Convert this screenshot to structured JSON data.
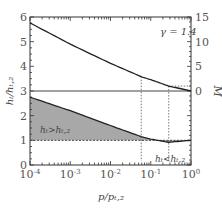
{
  "chart_data": {
    "type": "line",
    "title": "",
    "annotation": "γ = 1.4",
    "xlabel": "p/p_{t,2}",
    "ylabel_left": "h_t/h_{t,2}",
    "ylabel_right": "M",
    "xscale": "log",
    "xlim": [
      0.0001,
      1
    ],
    "ylim_left": [
      0,
      6
    ],
    "ylim_right_visible": [
      0,
      15
    ],
    "x_ticks": [
      "10^-4",
      "10^-3",
      "10^-2",
      "10^-1",
      "10^0"
    ],
    "y_left_ticks": [
      "0",
      "1",
      "2",
      "3",
      "4",
      "5",
      "6"
    ],
    "y_right_ticks": [
      "0",
      "5",
      "10",
      "15"
    ],
    "series": [
      {
        "name": "M (right axis)",
        "x": [
          0.0001,
          0.001,
          0.01,
          0.058,
          0.1,
          0.28,
          1
        ],
        "values": [
          13.8,
          9.5,
          5.6,
          2.9,
          2.3,
          1.0,
          0
        ]
      },
      {
        "name": "h_t/h_t,2 (left axis)",
        "x": [
          0.0001,
          0.001,
          0.01,
          0.058,
          0.1,
          0.28,
          1
        ],
        "values": [
          2.75,
          2.2,
          1.6,
          1.15,
          1.05,
          0.92,
          1.0
        ]
      }
    ],
    "reference_lines": [
      {
        "type": "horizontal",
        "axis": "left",
        "value": 3,
        "style": "solid",
        "note": "M = 0 baseline on right axis"
      },
      {
        "type": "horizontal",
        "axis": "left",
        "value": 1,
        "style": "dashed"
      },
      {
        "type": "vertical",
        "x": 0.058,
        "style": "dotted"
      },
      {
        "type": "vertical",
        "x": 0.28,
        "style": "dotted"
      }
    ],
    "regions": [
      {
        "label": "h_t > h_t,2",
        "fill": "#a0a0a0"
      },
      {
        "label": "h_t < h_t,2",
        "fill": "#a0a0a0"
      }
    ]
  },
  "labels": {
    "gamma": "γ = 1.4",
    "region_above": "hₜ>hₜ,₂",
    "region_below": "hₜ<hₜ,₂",
    "xlabel": "p/pₜ,₂",
    "ylabel_left": "hₜ/hₜ,₂",
    "ylabel_right": "M"
  }
}
